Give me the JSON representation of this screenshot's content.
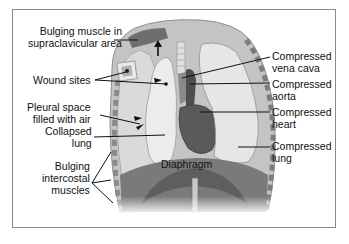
{
  "diagram": {
    "labels": {
      "bulging_muscle": [
        "Bulging muscle in",
        "supraclavicular area"
      ],
      "wound_sites": "Wound sites",
      "pleural_space": [
        "Pleural space",
        "filled with air"
      ],
      "collapsed_lung": [
        "Collapsed",
        "lung"
      ],
      "bulging_intercostal": [
        "Bulging",
        "intercostal",
        "muscles"
      ],
      "diaphragm": "Diaphragm",
      "compressed_vena_cava": [
        "Compressed",
        "vena cava"
      ],
      "compressed_aorta": [
        "Compressed",
        "aorta"
      ],
      "compressed_heart": [
        "Compressed",
        "heart"
      ],
      "compressed_lung": [
        "Compressed",
        "lung"
      ]
    },
    "colors": {
      "frame_border": "#8a8a8a",
      "chest_wall": "#b5b5b5",
      "pleural_air": "#d6d6d6",
      "lung_light": "#e8e8e8",
      "muscle_dark": "#6e6e6e",
      "heart": "#555555",
      "diaphragm": "#7a7a7a",
      "leader_line": "#111111"
    }
  }
}
